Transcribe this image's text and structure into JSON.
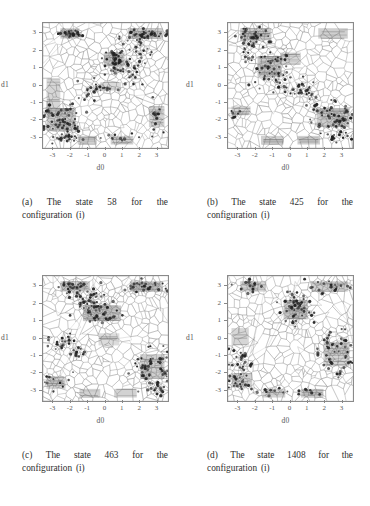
{
  "figure": {
    "page_background": "#ffffff",
    "ink_color": "#2e2e2e",
    "panels": [
      {
        "id": "a",
        "caption": "(a) The state 58 for the configuration (i)",
        "state": "58",
        "configuration": "(i)"
      },
      {
        "id": "b",
        "caption": "(b) The state 425 for the configuration (i)",
        "state": "425",
        "configuration": "(i)"
      },
      {
        "id": "c",
        "caption": "(c) The state 463 for the configuration (i)",
        "state": "463",
        "configuration": "(i)"
      },
      {
        "id": "d",
        "caption": "(d) The state 1408 for the configuration (i)",
        "state": "1408",
        "configuration": "(i)"
      }
    ]
  },
  "chart_data": [
    {
      "panel": "a",
      "type": "scatter",
      "title": "",
      "xlabel": "d0",
      "ylabel": "d1",
      "xlim": [
        -3.6,
        3.6
      ],
      "ylim": [
        -3.6,
        3.6
      ],
      "xticks": [
        -3,
        -2,
        -1,
        0,
        1,
        2,
        3
      ],
      "yticks": [
        -3,
        -2,
        -1,
        0,
        1,
        2,
        3
      ],
      "xticklabels": [
        "-3",
        "-2",
        "-1",
        "0",
        "1",
        "2",
        "3"
      ],
      "yticklabels": [
        "-3",
        "-2",
        "-1",
        "0",
        "1",
        "2",
        "3"
      ],
      "grid": false,
      "overlay": "voronoi-tessellation",
      "seed": 58,
      "n_voronoi_cells": 430,
      "shaded_regions": [
        {
          "x0": -2.6,
          "y0": 2.7,
          "x1": -1.5,
          "y1": 3.3,
          "density": 0.62
        },
        {
          "x0": 1.3,
          "y0": 2.7,
          "x1": 3.3,
          "y1": 3.3,
          "density": 0.66
        },
        {
          "x0": -0.1,
          "y0": 1.1,
          "x1": 1.1,
          "y1": 1.9,
          "density": 0.7
        },
        {
          "x0": -3.4,
          "y0": -2.6,
          "x1": -1.7,
          "y1": -1.3,
          "density": 0.68
        },
        {
          "x0": -3.4,
          "y0": -1.3,
          "x1": -2.6,
          "y1": 0.4,
          "density": 0.42
        },
        {
          "x0": 2.5,
          "y0": -2.4,
          "x1": 3.4,
          "y1": -1.2,
          "density": 0.5
        },
        {
          "x0": -1.6,
          "y0": -3.4,
          "x1": -0.5,
          "y1": -2.9,
          "density": 0.58
        },
        {
          "x0": 0.3,
          "y0": -3.4,
          "x1": 1.6,
          "y1": -2.9,
          "density": 0.58
        },
        {
          "x0": -0.3,
          "y0": -0.3,
          "x1": 0.9,
          "y1": 0.2,
          "density": 0.3
        }
      ],
      "point_clusters": [
        {
          "cx": -2.05,
          "cy": 3.0,
          "sx": 0.38,
          "sy": 0.1,
          "n": 26
        },
        {
          "cx": 2.35,
          "cy": 2.95,
          "sx": 0.75,
          "sy": 0.14,
          "n": 34
        },
        {
          "cx": 2.0,
          "cy": 2.1,
          "sx": 0.3,
          "sy": 0.45,
          "n": 20
        },
        {
          "cx": 0.55,
          "cy": 1.35,
          "sx": 0.35,
          "sy": 0.45,
          "n": 40
        },
        {
          "cx": 1.35,
          "cy": 0.75,
          "sx": 0.45,
          "sy": 0.35,
          "n": 22
        },
        {
          "cx": -0.55,
          "cy": -0.3,
          "sx": 0.55,
          "sy": 0.3,
          "n": 26
        },
        {
          "cx": -2.5,
          "cy": -2.1,
          "sx": 0.62,
          "sy": 0.55,
          "n": 58
        },
        {
          "cx": -2.3,
          "cy": -3.0,
          "sx": 0.45,
          "sy": 0.14,
          "n": 12
        },
        {
          "cx": 3.0,
          "cy": -1.9,
          "sx": 0.2,
          "sy": 0.6,
          "n": 14
        },
        {
          "cx": 0.9,
          "cy": -3.05,
          "sx": 0.55,
          "sy": 0.12,
          "n": 10
        }
      ],
      "n_background_points": 300
    },
    {
      "panel": "b",
      "type": "scatter",
      "title": "",
      "xlabel": "d0",
      "ylabel": "d1",
      "xlim": [
        -3.6,
        3.6
      ],
      "ylim": [
        -3.6,
        3.6
      ],
      "xticks": [
        -3,
        -2,
        -1,
        0,
        1,
        2,
        3
      ],
      "yticks": [
        -3,
        -2,
        -1,
        0,
        1,
        2,
        3
      ],
      "xticklabels": [
        "-3",
        "-2",
        "-1",
        "0",
        "1",
        "2",
        "3"
      ],
      "yticklabels": [
        "-3",
        "-2",
        "-1",
        "0",
        "1",
        "2",
        "3"
      ],
      "grid": false,
      "overlay": "voronoi-tessellation",
      "seed": 425,
      "n_voronoi_cells": 430,
      "shaded_regions": [
        {
          "x0": -2.9,
          "y0": 2.6,
          "x1": -1.1,
          "y1": 3.3,
          "density": 0.6
        },
        {
          "x0": 1.6,
          "y0": 2.7,
          "x1": 3.3,
          "y1": 3.3,
          "density": 0.58
        },
        {
          "x0": -1.9,
          "y0": 0.5,
          "x1": -0.5,
          "y1": 1.7,
          "density": 0.72
        },
        {
          "x0": -0.6,
          "y0": 1.2,
          "x1": 0.6,
          "y1": 1.9,
          "density": 0.4
        },
        {
          "x0": -3.4,
          "y0": -1.7,
          "x1": -2.3,
          "y1": -1.2,
          "density": 0.5
        },
        {
          "x0": 1.5,
          "y0": -2.4,
          "x1": 3.4,
          "y1": -1.3,
          "density": 0.66
        },
        {
          "x0": -1.7,
          "y0": -3.4,
          "x1": -0.4,
          "y1": -2.9,
          "density": 0.58
        },
        {
          "x0": 0.4,
          "y0": -3.4,
          "x1": 1.7,
          "y1": -2.9,
          "density": 0.58
        }
      ],
      "point_clusters": [
        {
          "cx": -2.1,
          "cy": 2.9,
          "sx": 0.55,
          "sy": 0.25,
          "n": 30
        },
        {
          "cx": -2.3,
          "cy": 2.2,
          "sx": 0.35,
          "sy": 0.4,
          "n": 16
        },
        {
          "cx": -1.2,
          "cy": 1.1,
          "sx": 0.5,
          "sy": 0.5,
          "n": 44
        },
        {
          "cx": -0.35,
          "cy": 0.05,
          "sx": 0.35,
          "sy": 0.3,
          "n": 14
        },
        {
          "cx": 0.85,
          "cy": -0.2,
          "sx": 0.4,
          "sy": 0.35,
          "n": 20
        },
        {
          "cx": 1.5,
          "cy": -1.1,
          "sx": 0.25,
          "sy": 0.35,
          "n": 12
        },
        {
          "cx": 2.6,
          "cy": -2.0,
          "sx": 0.6,
          "sy": 0.5,
          "n": 52
        },
        {
          "cx": 2.9,
          "cy": -3.0,
          "sx": 0.35,
          "sy": 0.15,
          "n": 10
        },
        {
          "cx": -3.1,
          "cy": -1.5,
          "sx": 0.2,
          "sy": 0.25,
          "n": 8
        }
      ],
      "n_background_points": 300
    },
    {
      "panel": "c",
      "type": "scatter",
      "title": "",
      "xlabel": "d0",
      "ylabel": "d1",
      "xlim": [
        -3.6,
        3.6
      ],
      "ylim": [
        -3.6,
        3.6
      ],
      "xticks": [
        -3,
        -2,
        -1,
        0,
        1,
        2,
        3
      ],
      "yticks": [
        -3,
        -2,
        -1,
        0,
        1,
        2,
        3
      ],
      "xticklabels": [
        "-3",
        "-2",
        "-1",
        "0",
        "1",
        "2",
        "3"
      ],
      "yticklabels": [
        "-3",
        "-2",
        "-1",
        "0",
        "1",
        "2",
        "3"
      ],
      "grid": false,
      "overlay": "voronoi-tessellation",
      "seed": 463,
      "n_voronoi_cells": 430,
      "shaded_regions": [
        {
          "x0": -2.6,
          "y0": 2.7,
          "x1": -0.9,
          "y1": 3.3,
          "density": 0.6
        },
        {
          "x0": 1.4,
          "y0": 2.7,
          "x1": 3.3,
          "y1": 3.3,
          "density": 0.62
        },
        {
          "x0": -1.3,
          "y0": 1.0,
          "x1": 0.9,
          "y1": 1.9,
          "density": 0.7
        },
        {
          "x0": -3.4,
          "y0": -2.9,
          "x1": -2.3,
          "y1": -2.2,
          "density": 0.5
        },
        {
          "x0": 2.0,
          "y0": -2.3,
          "x1": 3.4,
          "y1": -0.9,
          "density": 0.6
        },
        {
          "x0": -1.5,
          "y0": -3.4,
          "x1": -0.3,
          "y1": -2.9,
          "density": 0.55
        },
        {
          "x0": 0.5,
          "y0": -3.4,
          "x1": 1.8,
          "y1": -2.9,
          "density": 0.55
        },
        {
          "x0": -0.4,
          "y0": -0.4,
          "x1": 0.8,
          "y1": 0.3,
          "density": 0.28
        }
      ],
      "point_clusters": [
        {
          "cx": -1.85,
          "cy": 2.95,
          "sx": 0.5,
          "sy": 0.16,
          "n": 22
        },
        {
          "cx": 2.4,
          "cy": 2.95,
          "sx": 0.7,
          "sy": 0.16,
          "n": 26
        },
        {
          "cx": -1.0,
          "cy": 2.2,
          "sx": 0.5,
          "sy": 0.5,
          "n": 40
        },
        {
          "cx": -0.2,
          "cy": 1.5,
          "sx": 0.45,
          "sy": 0.4,
          "n": 30
        },
        {
          "cx": -2.6,
          "cy": -0.4,
          "sx": 0.55,
          "sy": 0.35,
          "n": 24
        },
        {
          "cx": -1.5,
          "cy": -0.9,
          "sx": 0.3,
          "sy": 0.3,
          "n": 10
        },
        {
          "cx": 2.7,
          "cy": -1.6,
          "sx": 0.55,
          "sy": 0.6,
          "n": 48
        },
        {
          "cx": 2.9,
          "cy": -2.9,
          "sx": 0.35,
          "sy": 0.22,
          "n": 14
        },
        {
          "cx": -3.0,
          "cy": -2.6,
          "sx": 0.25,
          "sy": 0.3,
          "n": 10
        }
      ],
      "n_background_points": 300
    },
    {
      "panel": "d",
      "type": "scatter",
      "title": "",
      "xlabel": "d0",
      "ylabel": "d1",
      "xlim": [
        -3.6,
        3.6
      ],
      "ylim": [
        -3.6,
        3.6
      ],
      "xticks": [
        -3,
        -2,
        -1,
        0,
        1,
        2,
        3
      ],
      "yticks": [
        -3,
        -2,
        -1,
        0,
        1,
        2,
        3
      ],
      "xticklabels": [
        "-3",
        "-2",
        "-1",
        "0",
        "1",
        "2",
        "3"
      ],
      "yticklabels": [
        "-3",
        "-2",
        "-1",
        "0",
        "1",
        "2",
        "3"
      ],
      "grid": false,
      "overlay": "voronoi-tessellation",
      "seed": 1408,
      "n_voronoi_cells": 430,
      "shaded_regions": [
        {
          "x0": -2.9,
          "y0": 2.7,
          "x1": -1.4,
          "y1": 3.3,
          "density": 0.52
        },
        {
          "x0": 1.2,
          "y0": 2.7,
          "x1": 3.3,
          "y1": 3.3,
          "density": 0.58
        },
        {
          "x0": -0.4,
          "y0": 1.1,
          "x1": 1.0,
          "y1": 2.2,
          "density": 0.72
        },
        {
          "x0": -3.4,
          "y0": -0.4,
          "x1": -2.4,
          "y1": 0.6,
          "density": 0.42
        },
        {
          "x0": 1.9,
          "y0": -1.6,
          "x1": 3.4,
          "y1": -0.2,
          "density": 0.5
        },
        {
          "x0": -3.4,
          "y0": -2.8,
          "x1": -2.2,
          "y1": -2.0,
          "density": 0.55
        },
        {
          "x0": -1.6,
          "y0": -3.4,
          "x1": -0.3,
          "y1": -2.9,
          "density": 0.55
        },
        {
          "x0": 0.6,
          "y0": -3.4,
          "x1": 1.9,
          "y1": -2.9,
          "density": 0.55
        }
      ],
      "point_clusters": [
        {
          "cx": -2.2,
          "cy": 2.9,
          "sx": 0.4,
          "sy": 0.2,
          "n": 14
        },
        {
          "cx": 2.2,
          "cy": 2.9,
          "sx": 0.7,
          "sy": 0.2,
          "n": 20
        },
        {
          "cx": 0.35,
          "cy": 1.75,
          "sx": 0.45,
          "sy": 0.55,
          "n": 46
        },
        {
          "cx": 2.6,
          "cy": -0.5,
          "sx": 0.5,
          "sy": 0.7,
          "n": 34
        },
        {
          "cx": 3.1,
          "cy": -1.5,
          "sx": 0.25,
          "sy": 0.35,
          "n": 12
        },
        {
          "cx": -2.8,
          "cy": -1.5,
          "sx": 0.4,
          "sy": 0.5,
          "n": 26
        },
        {
          "cx": -2.9,
          "cy": -2.5,
          "sx": 0.4,
          "sy": 0.3,
          "n": 18
        },
        {
          "cx": 1.0,
          "cy": -3.05,
          "sx": 0.5,
          "sy": 0.14,
          "n": 8
        },
        {
          "cx": -0.9,
          "cy": -3.05,
          "sx": 0.5,
          "sy": 0.14,
          "n": 8
        }
      ],
      "n_background_points": 300
    }
  ]
}
